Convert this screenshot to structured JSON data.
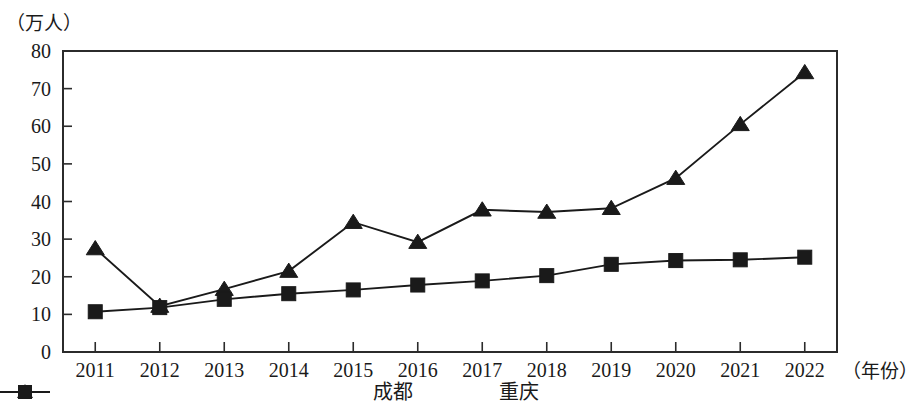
{
  "chart_data": {
    "type": "line",
    "title": "",
    "subtitle": "",
    "xlabel": "（年份）",
    "ylabel": "（万人）",
    "categories": [
      "2011",
      "2012",
      "2013",
      "2014",
      "2015",
      "2016",
      "2017",
      "2018",
      "2019",
      "2020",
      "2021",
      "2022"
    ],
    "yticks": [
      "0",
      "10",
      "20",
      "30",
      "40",
      "50",
      "60",
      "70",
      "80"
    ],
    "ylim": [
      0,
      80
    ],
    "grid": false,
    "legend_position": "bottom",
    "series": [
      {
        "name": "成都",
        "marker": "triangle",
        "color": "#1a1a1a",
        "values": [
          27.5,
          12.2,
          16.7,
          21.5,
          34.5,
          29.2,
          37.8,
          37.2,
          38.2,
          46.2,
          60.5,
          74.3
        ]
      },
      {
        "name": "重庆",
        "marker": "square",
        "color": "#1a1a1a",
        "values": [
          10.7,
          11.8,
          14.0,
          15.5,
          16.5,
          17.8,
          18.9,
          20.3,
          23.3,
          24.3,
          24.5,
          25.2
        ]
      }
    ]
  },
  "axis": {
    "unit_y": "（万人）",
    "unit_x": "（年份）"
  },
  "legend": {
    "items": [
      {
        "label": "成都",
        "marker": "triangle-marker-icon"
      },
      {
        "label": "重庆",
        "marker": "square-marker-icon"
      }
    ]
  }
}
